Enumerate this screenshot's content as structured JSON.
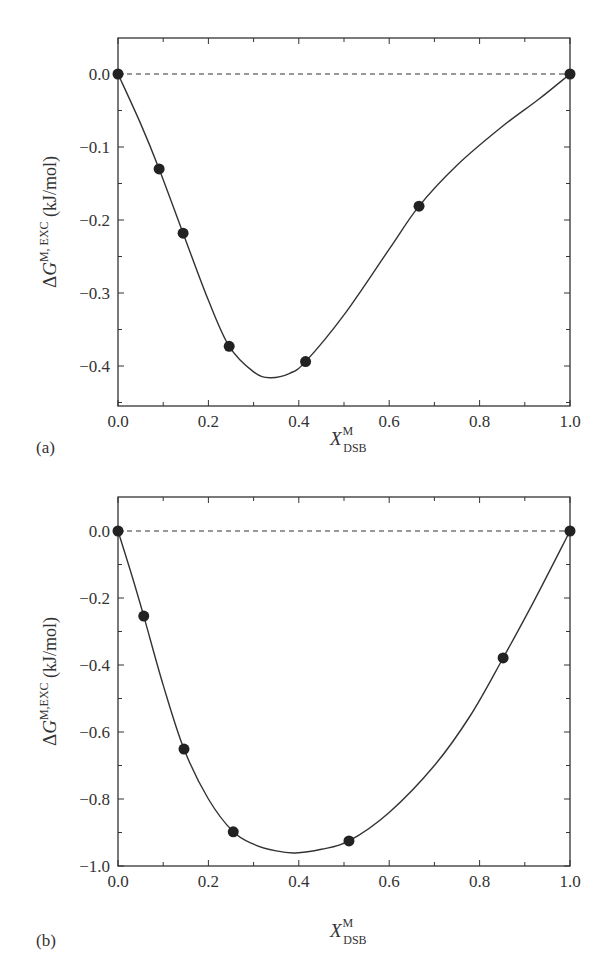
{
  "figure": {
    "panels": [
      {
        "label": "(a)",
        "ylabel_main": "ΔG",
        "ylabel_sup": "M, EXC",
        "ylabel_unit": "(kJ/mol)",
        "xlabel_main": "X",
        "xlabel_sup": "M",
        "xlabel_sub": "DSB"
      },
      {
        "label": "(b)",
        "ylabel_main": "ΔG",
        "ylabel_sup": "M,EXC",
        "ylabel_unit": "(kJ/mol)",
        "xlabel_main": "X",
        "xlabel_sup": "M",
        "xlabel_sub": "DSB"
      }
    ]
  },
  "chart_data": [
    {
      "type": "scatter",
      "panel": "(a)",
      "title": "",
      "xlabel": "X_DSB^M",
      "ylabel": "ΔG^{M, EXC} (kJ/mol)",
      "xlim": [
        0.0,
        1.0
      ],
      "ylim": [
        -0.455,
        0.05
      ],
      "xticks": [
        "0.0",
        "0.2",
        "0.4",
        "0.6",
        "0.8",
        "1.0"
      ],
      "yticks": [
        "0.0",
        "-0.1",
        "-0.2",
        "-0.3",
        "-0.4"
      ],
      "series": [
        {
          "name": "measured",
          "style": "filled circles",
          "x": [
            0.0,
            0.091,
            0.144,
            0.246,
            0.415,
            0.666,
            1.0
          ],
          "y": [
            0.0,
            -0.13,
            -0.218,
            -0.373,
            -0.394,
            -0.181,
            0.0
          ]
        },
        {
          "name": "fit",
          "style": "solid line",
          "x": [
            0.0,
            0.05,
            0.091,
            0.144,
            0.2,
            0.246,
            0.3,
            0.336,
            0.38,
            0.415,
            0.5,
            0.6,
            0.666,
            0.75,
            0.85,
            0.93,
            1.0
          ],
          "y": [
            0.0,
            -0.068,
            -0.13,
            -0.218,
            -0.31,
            -0.373,
            -0.408,
            -0.416,
            -0.41,
            -0.394,
            -0.33,
            -0.24,
            -0.181,
            -0.125,
            -0.072,
            -0.035,
            0.0
          ]
        },
        {
          "name": "zero line",
          "style": "dashed",
          "x": [
            0.0,
            1.0
          ],
          "y": [
            0.0,
            0.0
          ]
        }
      ],
      "grid": false,
      "legend": null
    },
    {
      "type": "scatter",
      "panel": "(b)",
      "title": "",
      "xlabel": "X_DSB^M",
      "ylabel": "ΔG^{M,EXC} (kJ/mol)",
      "xlim": [
        0.0,
        1.0
      ],
      "ylim": [
        -1.0,
        0.1
      ],
      "xticks": [
        "0.0",
        "0.2",
        "0.4",
        "0.6",
        "0.8",
        "1.0"
      ],
      "yticks": [
        "0.0",
        "-0.2",
        "-0.4",
        "-0.6",
        "-0.8",
        "-1.0"
      ],
      "series": [
        {
          "name": "measured",
          "style": "filled circles",
          "x": [
            0.0,
            0.057,
            0.146,
            0.255,
            0.511,
            0.852,
            1.0
          ],
          "y": [
            0.0,
            -0.254,
            -0.651,
            -0.898,
            -0.925,
            -0.379,
            0.0
          ]
        },
        {
          "name": "fit",
          "style": "solid line",
          "x": [
            0.0,
            0.03,
            0.057,
            0.1,
            0.146,
            0.2,
            0.255,
            0.3,
            0.35,
            0.392,
            0.45,
            0.511,
            0.6,
            0.7,
            0.78,
            0.852,
            0.92,
            1.0
          ],
          "y": [
            0.0,
            -0.13,
            -0.254,
            -0.46,
            -0.651,
            -0.8,
            -0.898,
            -0.935,
            -0.955,
            -0.961,
            -0.95,
            -0.925,
            -0.84,
            -0.7,
            -0.55,
            -0.379,
            -0.21,
            0.0
          ]
        },
        {
          "name": "zero line",
          "style": "dashed",
          "x": [
            0.0,
            1.0
          ],
          "y": [
            0.0,
            0.0
          ]
        }
      ],
      "grid": false,
      "legend": null
    }
  ]
}
